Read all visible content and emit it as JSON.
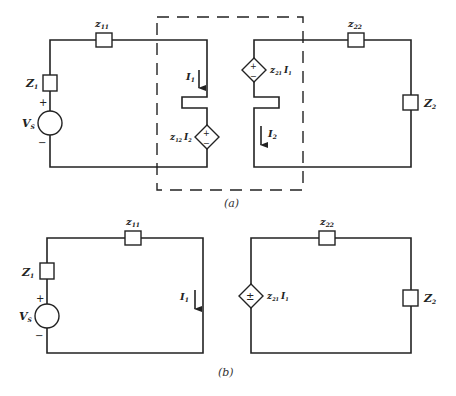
{
  "figure_a": {
    "caption": "(a)",
    "left_loop": {
      "series_impedance": {
        "label": "z",
        "sub": "11"
      },
      "source_impedance": {
        "label": "Z",
        "sub": "1"
      },
      "source": {
        "label": "V",
        "sub": "S",
        "plus": "+",
        "minus": "−"
      },
      "current": {
        "label": "I",
        "sub": "1"
      },
      "dependent_source": {
        "coef": "z",
        "coef_sub": "12",
        "var": "I",
        "var_sub": "2",
        "plus": "+",
        "minus": "−"
      }
    },
    "right_loop": {
      "series_impedance": {
        "label": "z",
        "sub": "22"
      },
      "load_impedance": {
        "label": "Z",
        "sub": "2"
      },
      "current": {
        "label": "I",
        "sub": "2"
      },
      "dependent_source": {
        "coef": "z",
        "coef_sub": "21",
        "var": "I",
        "var_sub": "1",
        "plus": "+",
        "minus": "−"
      }
    }
  },
  "figure_b": {
    "caption": "(b)",
    "left_loop": {
      "series_impedance": {
        "label": "z",
        "sub": "11"
      },
      "source_impedance": {
        "label": "Z",
        "sub": "1"
      },
      "source": {
        "label": "V",
        "sub": "S",
        "plus": "+",
        "minus": "−"
      },
      "current": {
        "label": "I",
        "sub": "1"
      }
    },
    "right_loop": {
      "series_impedance": {
        "label": "z",
        "sub": "22"
      },
      "load_impedance": {
        "label": "Z",
        "sub": "2"
      },
      "dependent_source": {
        "coef": "z",
        "coef_sub": "21",
        "var": "I",
        "var_sub": "1",
        "plus": "±"
      }
    }
  }
}
